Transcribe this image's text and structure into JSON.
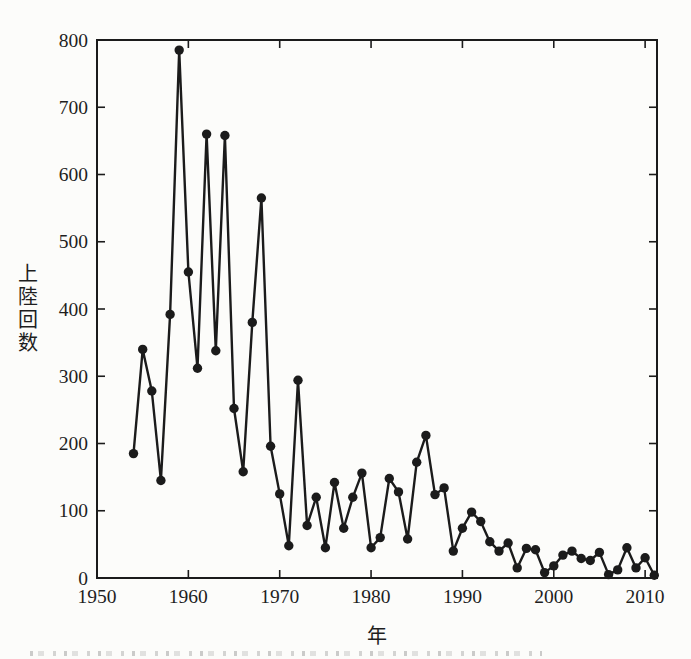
{
  "figure": {
    "background": "#fcfcfa",
    "ink_color": "#1b1b1b",
    "text_color": "#1e1e1e"
  },
  "chart_data": {
    "type": "line",
    "title": "",
    "xlabel": "年",
    "ylabel": "上陸回数",
    "legend": "none",
    "grid": false,
    "marker": "filled-circle",
    "line_color": "#1b1b1b",
    "xlim": [
      1950,
      2011.3
    ],
    "ylim": [
      0,
      800
    ],
    "x_ticks": [
      1950,
      1960,
      1970,
      1980,
      1990,
      2000,
      2010
    ],
    "y_ticks": [
      0,
      100,
      200,
      300,
      400,
      500,
      600,
      700,
      800
    ],
    "x": [
      1954,
      1955,
      1956,
      1957,
      1958,
      1959,
      1960,
      1961,
      1962,
      1963,
      1964,
      1965,
      1966,
      1967,
      1968,
      1969,
      1970,
      1971,
      1972,
      1973,
      1974,
      1975,
      1976,
      1977,
      1978,
      1979,
      1980,
      1981,
      1982,
      1983,
      1984,
      1985,
      1986,
      1987,
      1988,
      1989,
      1990,
      1991,
      1992,
      1993,
      1994,
      1995,
      1996,
      1997,
      1998,
      1999,
      2000,
      2001,
      2002,
      2003,
      2004,
      2005,
      2006,
      2007,
      2008,
      2009,
      2010,
      2011
    ],
    "values": [
      185,
      340,
      278,
      145,
      392,
      785,
      455,
      312,
      660,
      338,
      658,
      252,
      158,
      380,
      565,
      196,
      125,
      48,
      294,
      78,
      120,
      45,
      142,
      74,
      120,
      156,
      45,
      60,
      148,
      128,
      58,
      172,
      212,
      124,
      134,
      40,
      74,
      98,
      84,
      54,
      40,
      52,
      15,
      44,
      42,
      8,
      18,
      34,
      40,
      29,
      26,
      38,
      5,
      12,
      45,
      15,
      30,
      4
    ]
  }
}
